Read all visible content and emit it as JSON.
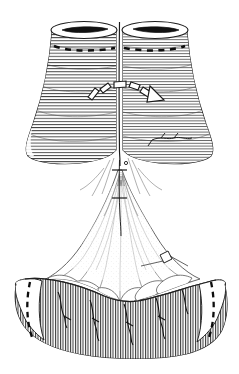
{
  "figure": {
    "domain": "Natural-Image",
    "kind": "medical-line-illustration",
    "caption": "",
    "background_color": "#ffffff",
    "ink_color": "#1a1a1a",
    "hatch_color": "#2b2b2b",
    "light_ink_color": "#6e6e6e",
    "canvas": {
      "width": 239,
      "height": 374
    },
    "visible_text": [],
    "labels": [],
    "parts": [
      {
        "id": "upper-left-cylinder",
        "name": "upper-left-tubular-segment",
        "description": "Left cylindrical tubular segment, horizontally hatched, flaring outward at lower left",
        "hatching": "horizontal-lines",
        "top_opening": "elliptical-lumen-with-dark-slit",
        "suture_line": "dashed"
      },
      {
        "id": "upper-right-cylinder",
        "name": "upper-right-tubular-segment",
        "description": "Right cylindrical tubular segment, horizontally hatched, flaring outward at lower right",
        "hatching": "horizontal-lines",
        "top_opening": "elliptical-lumen-with-dark-slit",
        "suture_line": "dashed"
      },
      {
        "id": "central-seam",
        "name": "central-anastomosis-seam",
        "description": "Vertical seam line where the two tubular segments meet"
      },
      {
        "id": "curved-dashed-arrow",
        "name": "curved-direction-arrow",
        "description": "Arc of five rectangular dashes rising left-to-right over the seam, terminating in an open triangular arrowhead pointing right-downward",
        "dash_count": 5,
        "arrowhead": "open-triangle",
        "direction": "left-to-right-over-seam"
      },
      {
        "id": "central-suture-thread",
        "name": "central-suture-thread",
        "description": "Vertical thread running down the midline channel with two small transverse knot crossbars"
      },
      {
        "id": "mesentery-fan",
        "name": "mesenteric-fan",
        "description": "Fan-shaped translucent membrane spreading downward from the midline with radiating stippled vessels"
      },
      {
        "id": "needle-instrument",
        "name": "needle-instrument",
        "description": "Small rectangular needle / instrument tip on the right side of the mesenteric fan"
      },
      {
        "id": "lower-organ",
        "name": "lower-tubular-organ",
        "description": "Broad curved lower tubular organ with dense vertical hatching and dashed suture lines at both lateral ends",
        "hatching": "dense-vertical-lines",
        "left_suture_line": "dashed",
        "right_suture_line": "dashed"
      }
    ]
  }
}
